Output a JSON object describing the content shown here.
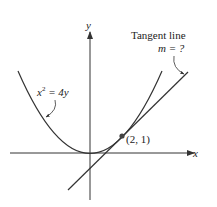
{
  "diagram": {
    "axes": {
      "x_label": "x",
      "y_label": "y"
    },
    "curve": {
      "equation_lhs": "x",
      "equation_exp": "2",
      "equation_rhs": " = 4y"
    },
    "tangent": {
      "title": "Tangent line",
      "slope_label": "m = ?"
    },
    "point": {
      "label": "(2, 1)"
    },
    "colors": {
      "line": "#333333",
      "point": "#444444"
    }
  }
}
